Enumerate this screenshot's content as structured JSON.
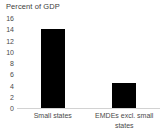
{
  "chart_data": {
    "type": "bar",
    "title": "Percent of GDP",
    "xlabel": "",
    "ylabel": "",
    "categories": [
      "Small states",
      "EMDEs excl. small states"
    ],
    "values": [
      14.0,
      4.5
    ],
    "ylim": [
      0,
      16
    ],
    "yticks": [
      0,
      2,
      4,
      6,
      8,
      10,
      12,
      14,
      16
    ],
    "ytick_labels": [
      "0",
      "2",
      "4",
      "6",
      "8",
      "10",
      "12",
      "14",
      "16"
    ],
    "grid": false,
    "legend": null,
    "bar_color": "#000000",
    "axis_line_color": "#d2d2d2",
    "text_color": "#4a4a4a",
    "background": "#ffffff"
  },
  "labels": {
    "category_lines": [
      [
        "Small states"
      ],
      [
        "EMDEs excl. small",
        "states"
      ]
    ]
  }
}
